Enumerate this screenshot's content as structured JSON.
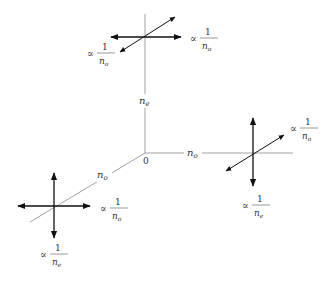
{
  "diagram": {
    "origin_label": "0",
    "axes": [
      {
        "id": "vertical",
        "label": "n",
        "sub": "e"
      },
      {
        "id": "horizontal",
        "label": "n",
        "sub": "o"
      },
      {
        "id": "diagonal",
        "label": "n",
        "sub": "o"
      }
    ],
    "clusters": [
      {
        "id": "top",
        "labels": [
          {
            "prop": "∝",
            "num": "1",
            "den": "n",
            "sub": "o"
          },
          {
            "prop": "∝",
            "num": "1",
            "den": "n",
            "sub": "o"
          }
        ]
      },
      {
        "id": "right",
        "labels": [
          {
            "prop": "∝",
            "num": "1",
            "den": "n",
            "sub": "o"
          },
          {
            "prop": "∝",
            "num": "1",
            "den": "n",
            "sub": "e"
          }
        ]
      },
      {
        "id": "left",
        "labels": [
          {
            "prop": "∝",
            "num": "1",
            "den": "n",
            "sub": "o"
          },
          {
            "prop": "∝",
            "num": "1",
            "den": "n",
            "sub": "e"
          }
        ]
      }
    ]
  }
}
